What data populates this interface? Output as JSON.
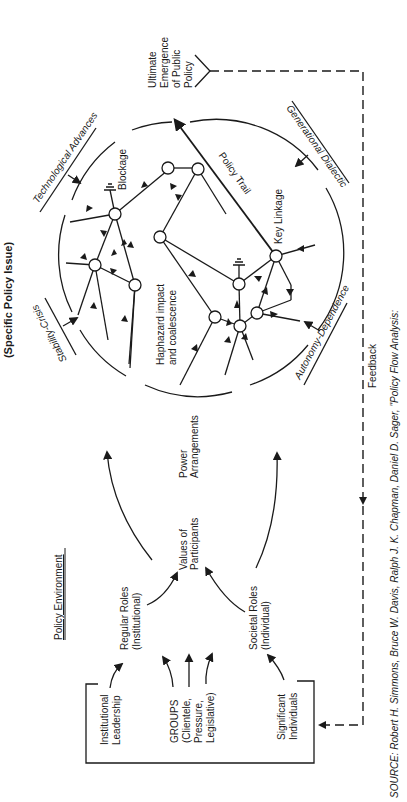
{
  "diagram": {
    "title": "(Specific Policy Issue)",
    "orientation": "rotated 90° counter-clockwise",
    "circle_labels": {
      "technological_advances": "Technological Advances",
      "stability_crisis": "Stability-Crisis",
      "generational_dialectic": "Generational Dialectic",
      "autonomy_dependence": "Autonomy-Dependence",
      "blockage": "Blockage",
      "policy_trail": "Policy Trail",
      "key_linkage": "Key Linkage",
      "haphazard_line1": "Haphazard impact",
      "haphazard_line2": "and coalescence"
    },
    "outcome": {
      "line1": "Ultimate",
      "line2": "Emergence",
      "line3": "of Public",
      "line4": "Policy"
    },
    "feedback_label": "Feedback",
    "environment": {
      "heading": "Policy Environment",
      "power_line1": "Power",
      "power_line2": "Arrangements",
      "values_line1": "Values of",
      "values_line2": "Participants",
      "regular_roles_line1": "Regular Roles",
      "regular_roles_line2": "(Institutional)",
      "societal_roles_line1": "Societal Roles",
      "societal_roles_line2": "(Individual)",
      "inst_leadership_line1": "Institutional",
      "inst_leadership_line2": "Leadership",
      "groups_line1": "GROUPS",
      "groups_line2": "(Clientele,",
      "groups_line3": "Pressure,",
      "groups_line4": "Legislative)",
      "significant_line1": "Significant",
      "significant_line2": "Individuals"
    },
    "source_line1": "SOURCE:  Robert H. Simmons, Bruce W. Davis, Ralph J. K. Chapman, Daniel D. Sager, \"Policy Flow Analysis:",
    "colors": {
      "ink": "#1a1a1a",
      "paper": "#ffffff"
    }
  }
}
